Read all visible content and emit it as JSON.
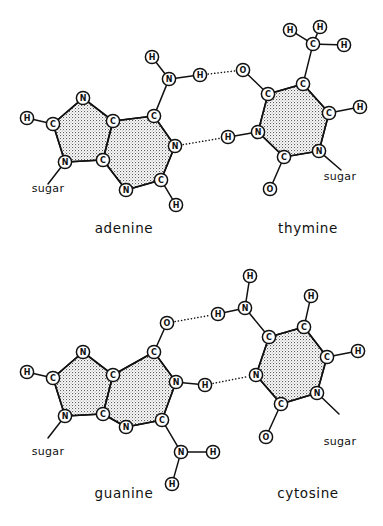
{
  "figure": {
    "background_color": "#ffffff",
    "line_color": "#111111",
    "ring_fill_color": "#cfcfcf",
    "width": 383,
    "height": 526
  },
  "pairs": [
    {
      "id": "adenine-thymine",
      "left_label": "adenine",
      "right_label": "thymine",
      "left_sugar_label": "sugar",
      "right_sugar_label": "sugar",
      "hydrogen_bond_count": 2,
      "left_label_pos": [
        124,
        233
      ],
      "right_label_pos": [
        308,
        233
      ],
      "left_sugar_pos": [
        48,
        192
      ],
      "right_sugar_pos": [
        340,
        180
      ],
      "molecules": {
        "left": {
          "name": "adenine",
          "atoms": [
            {
              "id": "aH6a",
              "element": "H",
              "x": 27,
              "y": 118
            },
            {
              "id": "aC8",
              "element": "C",
              "x": 53,
              "y": 124
            },
            {
              "id": "aN7",
              "element": "N",
              "x": 83,
              "y": 98
            },
            {
              "id": "aC5",
              "element": "C",
              "x": 113,
              "y": 121
            },
            {
              "id": "aC4",
              "element": "C",
              "x": 103,
              "y": 160
            },
            {
              "id": "aN9",
              "element": "N",
              "x": 65,
              "y": 162
            },
            {
              "id": "aC6",
              "element": "C",
              "x": 154,
              "y": 116
            },
            {
              "id": "aN1",
              "element": "N",
              "x": 175,
              "y": 146
            },
            {
              "id": "aC2",
              "element": "C",
              "x": 161,
              "y": 180
            },
            {
              "id": "aN3",
              "element": "N",
              "x": 126,
              "y": 190
            },
            {
              "id": "aH2",
              "element": "H",
              "x": 176,
              "y": 205
            },
            {
              "id": "aN6",
              "element": "N",
              "x": 169,
              "y": 79
            },
            {
              "id": "aH6b",
              "element": "H",
              "x": 152,
              "y": 57
            },
            {
              "id": "aH6c",
              "element": "H",
              "x": 200,
              "y": 75
            }
          ],
          "ring_polygons": [
            [
              "aC8",
              "aN7",
              "aC5",
              "aC4",
              "aN9"
            ],
            [
              "aC5",
              "aC6",
              "aN1",
              "aC2",
              "aN3",
              "aC4"
            ]
          ],
          "bonds": [
            [
              "aH6a",
              "aC8"
            ],
            [
              "aC8",
              "aN7"
            ],
            [
              "aN7",
              "aC5"
            ],
            [
              "aC5",
              "aC4"
            ],
            [
              "aC4",
              "aN9"
            ],
            [
              "aN9",
              "aC8"
            ],
            [
              "aC5",
              "aC6"
            ],
            [
              "aC6",
              "aN1"
            ],
            [
              "aN1",
              "aC2"
            ],
            [
              "aC2",
              "aN3"
            ],
            [
              "aN3",
              "aC4"
            ],
            [
              "aC2",
              "aH2"
            ],
            [
              "aC6",
              "aN6"
            ],
            [
              "aN6",
              "aH6b"
            ],
            [
              "aN6",
              "aH6c"
            ]
          ],
          "sugar_bond": [
            "aN9",
            48,
            184
          ]
        },
        "right": {
          "name": "thymine",
          "atoms": [
            {
              "id": "tC7",
              "element": "C",
              "x": 313,
              "y": 44
            },
            {
              "id": "tH7a",
              "element": "H",
              "x": 290,
              "y": 30
            },
            {
              "id": "tH7b",
              "element": "H",
              "x": 320,
              "y": 27
            },
            {
              "id": "tH7c",
              "element": "H",
              "x": 344,
              "y": 45
            },
            {
              "id": "tC5",
              "element": "C",
              "x": 303,
              "y": 84
            },
            {
              "id": "tC6",
              "element": "C",
              "x": 329,
              "y": 113
            },
            {
              "id": "tH6",
              "element": "H",
              "x": 360,
              "y": 107
            },
            {
              "id": "tN1",
              "element": "N",
              "x": 319,
              "y": 151
            },
            {
              "id": "tC2",
              "element": "C",
              "x": 284,
              "y": 157
            },
            {
              "id": "tO2",
              "element": "O",
              "x": 270,
              "y": 189
            },
            {
              "id": "tN3",
              "element": "N",
              "x": 258,
              "y": 132
            },
            {
              "id": "tC4",
              "element": "C",
              "x": 268,
              "y": 94
            },
            {
              "id": "tO4",
              "element": "O",
              "x": 243,
              "y": 70
            },
            {
              "id": "tH3",
              "element": "H",
              "x": 228,
              "y": 137
            }
          ],
          "ring_polygons": [
            [
              "tC5",
              "tC6",
              "tN1",
              "tC2",
              "tN3",
              "tC4"
            ]
          ],
          "bonds": [
            [
              "tC7",
              "tH7a"
            ],
            [
              "tC7",
              "tH7b"
            ],
            [
              "tC7",
              "tH7c"
            ],
            [
              "tC7",
              "tC5"
            ],
            [
              "tC5",
              "tC6"
            ],
            [
              "tC6",
              "tH6"
            ],
            [
              "tC6",
              "tN1"
            ],
            [
              "tN1",
              "tC2"
            ],
            [
              "tC2",
              "tO2"
            ],
            [
              "tC2",
              "tN3"
            ],
            [
              "tN3",
              "tC4"
            ],
            [
              "tC4",
              "tC5"
            ],
            [
              "tC4",
              "tO4"
            ],
            [
              "tN3",
              "tH3"
            ]
          ],
          "sugar_bond": [
            "tN1",
            341,
            170
          ]
        }
      },
      "hydrogen_bonds": [
        {
          "from": "aH6c",
          "to": "tO4",
          "label": "N6-H...O4"
        },
        {
          "from": "aN1",
          "to": "tH3",
          "label": "N1...H-N3"
        }
      ]
    },
    {
      "id": "guanine-cytosine",
      "left_label": "guanine",
      "right_label": "cytosine",
      "left_sugar_label": "sugar",
      "right_sugar_label": "sugar",
      "hydrogen_bond_count": 2,
      "left_label_pos": [
        124,
        498
      ],
      "right_label_pos": [
        308,
        498
      ],
      "left_sugar_pos": [
        48,
        455
      ],
      "right_sugar_pos": [
        340,
        445
      ],
      "molecules": {
        "left": {
          "name": "guanine",
          "atoms": [
            {
              "id": "gH8a",
              "element": "H",
              "x": 27,
              "y": 372
            },
            {
              "id": "gC8",
              "element": "C",
              "x": 53,
              "y": 378
            },
            {
              "id": "gN7",
              "element": "N",
              "x": 83,
              "y": 352
            },
            {
              "id": "gC5",
              "element": "C",
              "x": 113,
              "y": 375
            },
            {
              "id": "gC4",
              "element": "C",
              "x": 103,
              "y": 414
            },
            {
              "id": "gN9",
              "element": "N",
              "x": 65,
              "y": 416
            },
            {
              "id": "gC6",
              "element": "C",
              "x": 154,
              "y": 352
            },
            {
              "id": "gO6",
              "element": "O",
              "x": 167,
              "y": 323
            },
            {
              "id": "gN1",
              "element": "N",
              "x": 176,
              "y": 382
            },
            {
              "id": "gH1",
              "element": "H",
              "x": 205,
              "y": 385
            },
            {
              "id": "gC2",
              "element": "C",
              "x": 162,
              "y": 420
            },
            {
              "id": "gN3",
              "element": "N",
              "x": 126,
              "y": 427
            },
            {
              "id": "gN2",
              "element": "N",
              "x": 181,
              "y": 452
            },
            {
              "id": "gH2a",
              "element": "H",
              "x": 213,
              "y": 452
            },
            {
              "id": "gH2b",
              "element": "H",
              "x": 172,
              "y": 484
            }
          ],
          "ring_polygons": [
            [
              "gC8",
              "gN7",
              "gC5",
              "gC4",
              "gN9"
            ],
            [
              "gC5",
              "gC6",
              "gN1",
              "gC2",
              "gN3",
              "gC4"
            ]
          ],
          "bonds": [
            [
              "gH8a",
              "gC8"
            ],
            [
              "gC8",
              "gN7"
            ],
            [
              "gN7",
              "gC5"
            ],
            [
              "gC5",
              "gC4"
            ],
            [
              "gC4",
              "gN9"
            ],
            [
              "gN9",
              "gC8"
            ],
            [
              "gC5",
              "gC6"
            ],
            [
              "gC6",
              "gO6"
            ],
            [
              "gC6",
              "gN1"
            ],
            [
              "gN1",
              "gH1"
            ],
            [
              "gN1",
              "gC2"
            ],
            [
              "gC2",
              "gN3"
            ],
            [
              "gN3",
              "gC4"
            ],
            [
              "gC2",
              "gN2"
            ],
            [
              "gN2",
              "gH2a"
            ],
            [
              "gN2",
              "gH2b"
            ]
          ],
          "sugar_bond": [
            "gN9",
            48,
            438
          ]
        },
        "right": {
          "name": "cytosine",
          "atoms": [
            {
              "id": "cN4",
              "element": "N",
              "x": 245,
              "y": 308
            },
            {
              "id": "cH4a",
              "element": "H",
              "x": 250,
              "y": 276
            },
            {
              "id": "cH4b",
              "element": "H",
              "x": 218,
              "y": 314
            },
            {
              "id": "cC4",
              "element": "C",
              "x": 269,
              "y": 337
            },
            {
              "id": "cC5",
              "element": "C",
              "x": 304,
              "y": 327
            },
            {
              "id": "cH5",
              "element": "H",
              "x": 311,
              "y": 296
            },
            {
              "id": "cC6",
              "element": "C",
              "x": 327,
              "y": 357
            },
            {
              "id": "cH6",
              "element": "H",
              "x": 358,
              "y": 351
            },
            {
              "id": "cN1",
              "element": "N",
              "x": 317,
              "y": 393
            },
            {
              "id": "cC2",
              "element": "C",
              "x": 281,
              "y": 404
            },
            {
              "id": "cO2",
              "element": "O",
              "x": 266,
              "y": 437
            },
            {
              "id": "cN3",
              "element": "N",
              "x": 256,
              "y": 375
            }
          ],
          "ring_polygons": [
            [
              "cC4",
              "cC5",
              "cC6",
              "cN1",
              "cC2",
              "cN3"
            ]
          ],
          "bonds": [
            [
              "cN4",
              "cH4a"
            ],
            [
              "cN4",
              "cH4b"
            ],
            [
              "cN4",
              "cC4"
            ],
            [
              "cC4",
              "cC5"
            ],
            [
              "cC5",
              "cH5"
            ],
            [
              "cC5",
              "cC6"
            ],
            [
              "cC6",
              "cH6"
            ],
            [
              "cC6",
              "cN1"
            ],
            [
              "cN1",
              "cC2"
            ],
            [
              "cC2",
              "cO2"
            ],
            [
              "cC2",
              "cN3"
            ],
            [
              "cN3",
              "cC4"
            ]
          ],
          "sugar_bond": [
            "cN1",
            339,
            414
          ]
        }
      },
      "hydrogen_bonds": [
        {
          "from": "gO6",
          "to": "cH4b",
          "label": "O6...H-N4"
        },
        {
          "from": "gH1",
          "to": "cN3",
          "label": "N1-H...N3"
        }
      ]
    }
  ]
}
